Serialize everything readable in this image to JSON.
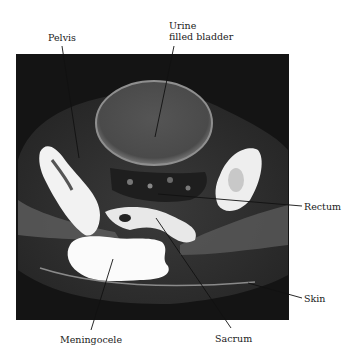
{
  "figure": {
    "colors": {
      "background": "#ffffff",
      "scan_background": "#141414",
      "bone": "#f2f2f2",
      "soft_tissue": "#5a5a5a",
      "bladder": "#4a4a4a",
      "label_text": "#1a1a1a",
      "leader_line": "#111111"
    },
    "labels": [
      {
        "id": "pelvis",
        "text": "Pelvis"
      },
      {
        "id": "bladder_line1",
        "text": "Urine"
      },
      {
        "id": "bladder_line2",
        "text": "filled bladder"
      },
      {
        "id": "rectum",
        "text": "Rectum"
      },
      {
        "id": "skin",
        "text": "Skin"
      },
      {
        "id": "meningocele",
        "text": "Meningocele"
      },
      {
        "id": "sacrum",
        "text": "Sacrum"
      }
    ]
  }
}
